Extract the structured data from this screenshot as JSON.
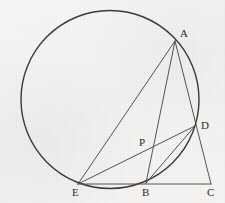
{
  "figure": {
    "background_color": "#f3f3f2",
    "stroke_color": "#3a3a3a",
    "label_color": "#2b2b2b",
    "canvas": {
      "width": 225,
      "height": 203
    }
  },
  "circle": {
    "name": "circumscribed-circle",
    "cx": 110,
    "cy": 99.5,
    "r": 89,
    "stroke_width": 1.4
  },
  "points": [
    {
      "id": "A",
      "label": "A",
      "x": 175,
      "y": 41,
      "label_x": 180,
      "label_y": 28,
      "on_circle": true
    },
    {
      "id": "D",
      "label": "D",
      "x": 195,
      "y": 126,
      "label_x": 201,
      "label_y": 120,
      "on_circle": true
    },
    {
      "id": "C",
      "label": "C",
      "x": 211,
      "y": 184,
      "label_x": 207,
      "label_y": 187,
      "on_circle": false
    },
    {
      "id": "B",
      "label": "B",
      "x": 146,
      "y": 183,
      "label_x": 142,
      "label_y": 187,
      "on_circle": true
    },
    {
      "id": "E",
      "label": "E",
      "x": 78,
      "y": 184,
      "label_x": 72,
      "label_y": 187,
      "on_circle": true
    },
    {
      "id": "P",
      "label": "P",
      "x": 146,
      "y": 150,
      "label_x": 139,
      "label_y": 137,
      "on_circle": false
    }
  ],
  "segments": [
    {
      "name": "segment-A-E",
      "from": "A",
      "to": "E",
      "x1": 175,
      "y1": 41,
      "x2": 78,
      "y2": 184
    },
    {
      "name": "segment-A-B",
      "from": "A",
      "to": "B",
      "x1": 175,
      "y1": 41,
      "x2": 146,
      "y2": 183
    },
    {
      "name": "segment-A-C",
      "from": "A",
      "to": "C",
      "x1": 175,
      "y1": 41,
      "x2": 211,
      "y2": 184
    },
    {
      "name": "segment-E-D",
      "from": "E",
      "to": "D",
      "x1": 78,
      "y1": 184,
      "x2": 195,
      "y2": 126
    },
    {
      "name": "segment-E-C",
      "from": "E",
      "to": "C",
      "x1": 78,
      "y1": 184,
      "x2": 211,
      "y2": 184
    },
    {
      "name": "segment-B-D",
      "from": "B",
      "to": "D",
      "x1": 146,
      "y1": 183,
      "x2": 195,
      "y2": 126
    }
  ],
  "notes": {
    "collinear_A_D_C": "A, D and C lie on one straight line",
    "intersection_P": "P is where chord AB crosses chord ED",
    "base_line": "E, B and C lie on one straight horizontal line"
  }
}
